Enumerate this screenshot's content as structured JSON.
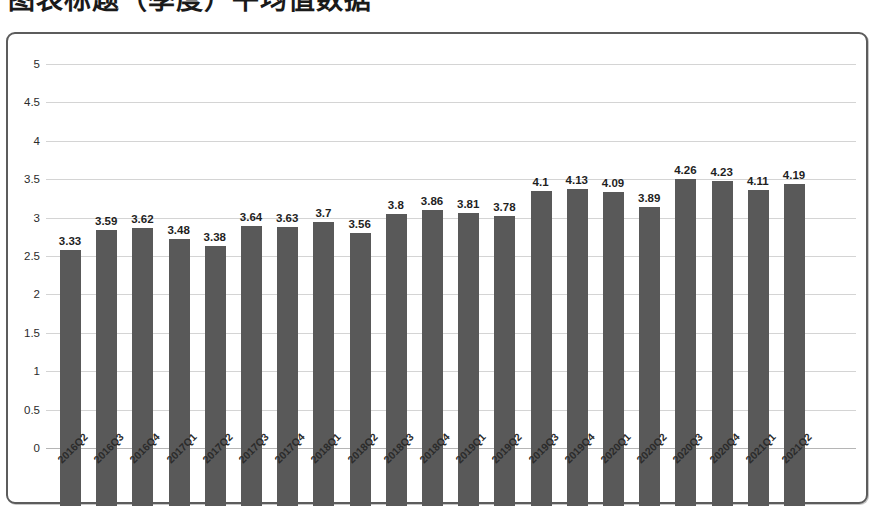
{
  "title": "图表标题（季度）平均值数据",
  "chart_data": {
    "type": "bar",
    "title": "",
    "xlabel": "",
    "ylabel": "",
    "ylim": [
      0,
      5
    ],
    "ytick_step": 0.5,
    "yticks": [
      "5",
      "4.5",
      "4",
      "3.5",
      "3",
      "2.5",
      "2",
      "1.5",
      "1",
      "0.5",
      "0"
    ],
    "grid": true,
    "legend": false,
    "bar_color": "#595959",
    "gridline_color": "#d4d4d4",
    "categories": [
      "2016Q2",
      "2016Q3",
      "2016Q4",
      "2017Q1",
      "2017Q2",
      "2017Q3",
      "2017Q4",
      "2018Q1",
      "2018Q2",
      "2018Q3",
      "2018Q4",
      "2019Q1",
      "2019Q2",
      "2019Q3",
      "2019Q4",
      "2020Q1",
      "2020Q2",
      "2020Q3",
      "2020Q4",
      "2021Q1",
      "2021Q2"
    ],
    "values": [
      3.33,
      3.59,
      3.62,
      3.48,
      3.38,
      3.64,
      3.63,
      3.7,
      3.56,
      3.8,
      3.86,
      3.81,
      3.78,
      4.1,
      4.13,
      4.09,
      3.89,
      4.26,
      4.23,
      4.11,
      4.19
    ],
    "data_labels": [
      "3.33",
      "3.59",
      "3.62",
      "3.48",
      "3.38",
      "3.64",
      "3.63",
      "3.7",
      "3.56",
      "3.8",
      "3.86",
      "3.81",
      "3.78",
      "4.1",
      "4.13",
      "4.09",
      "3.89",
      "4.26",
      "4.23",
      "4.11",
      "4.19"
    ]
  }
}
